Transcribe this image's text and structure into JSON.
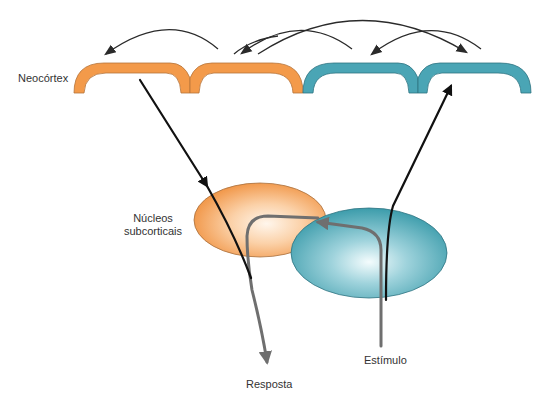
{
  "diagram": {
    "labels": {
      "neocortex": "Neocórtex",
      "nucleos_line1": "Núcleos",
      "nucleos_line2": "subcorticais",
      "resposta": "Resposta",
      "estimulo": "Estímulo"
    },
    "colors": {
      "orange_cortex": "#f39a4a",
      "orange_stroke": "#b5733a",
      "teal_cortex": "#4aa5b5",
      "teal_stroke": "#2f7482",
      "orange_nucleus_center": "#fff3e6",
      "orange_nucleus_edge": "#f19a4c",
      "teal_nucleus_center": "#f2fbfc",
      "teal_nucleus_edge": "#3f9fae",
      "black_arrow": "#111111",
      "gray_arrow": "#6f6f6f",
      "thin_arrow": "#2a2a2a"
    },
    "regions": [
      {
        "name": "neocortex-orange-arch-1",
        "color": "orange"
      },
      {
        "name": "neocortex-orange-arch-2",
        "color": "orange"
      },
      {
        "name": "neocortex-teal-arch-1",
        "color": "teal"
      },
      {
        "name": "neocortex-teal-arch-2",
        "color": "teal"
      },
      {
        "name": "subcortical-nucleus-orange",
        "color": "orange"
      },
      {
        "name": "subcortical-nucleus-teal",
        "color": "teal"
      }
    ],
    "pathways": [
      {
        "name": "cortex-to-nucleus-arrow",
        "color": "black",
        "direction": "down"
      },
      {
        "name": "stimulus-to-cortex-arrow",
        "color": "black",
        "direction": "up"
      },
      {
        "name": "stimulus-to-response-arrow",
        "color": "gray",
        "direction": "loop"
      },
      {
        "name": "cortico-cortical-arrows",
        "color": "dark-gray",
        "count": 5
      }
    ]
  }
}
